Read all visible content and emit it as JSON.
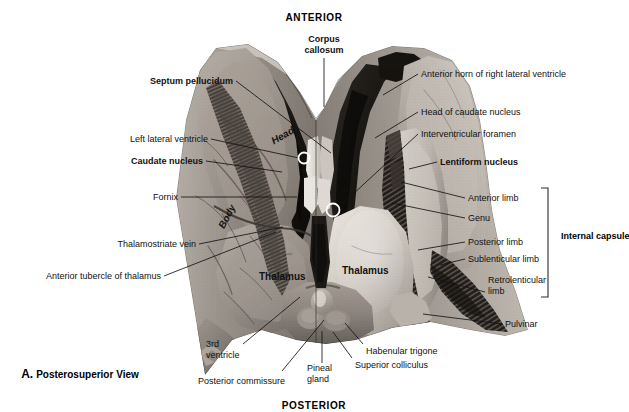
{
  "figure": {
    "panel_letter": "A.",
    "panel_title": "Posterosuperior View",
    "orientation_top": "ANTERIOR",
    "orientation_bottom": "POSTERIOR",
    "view_type": "Posterosuperior View",
    "colors": {
      "background": "#ffffff",
      "text": "#111111",
      "leader_line": "#1a1a1a",
      "bracket": "#2a2a2a",
      "marker_ring": "#ffffff",
      "specimen_light": "#d8d4cf",
      "specimen_mid": "#9b948d",
      "specimen_dark": "#3a3733",
      "specimen_darkest": "#141312"
    }
  },
  "labels_left": [
    {
      "id": "septum-pellucidum",
      "text": "Septum pellucidum",
      "bold": true,
      "x": 233,
      "y": 76,
      "line": [
        236,
        81,
        331,
        153
      ]
    },
    {
      "id": "left-lateral-ventricle",
      "text": "Left lateral ventricle",
      "bold": false,
      "x": 208,
      "y": 134,
      "line": [
        211,
        139,
        299,
        158
      ]
    },
    {
      "id": "caudate-nucleus",
      "text": "Caudate nucleus",
      "bold": true,
      "x": 203,
      "y": 156,
      "line": [
        206,
        161,
        282,
        172
      ]
    },
    {
      "id": "fornix",
      "text": "Fornix",
      "bold": false,
      "x": 178,
      "y": 192,
      "line": [
        181,
        197,
        297,
        197
      ]
    },
    {
      "id": "thalamostriate-vein",
      "text": "Thalamostriate vein",
      "bold": false,
      "x": 196,
      "y": 239,
      "line": [
        199,
        244,
        283,
        227
      ]
    },
    {
      "id": "anterior-tubercle-of-thalamus",
      "text": "Anterior tubercle of thalamus",
      "bold": false,
      "x": 161,
      "y": 271,
      "line": [
        164,
        276,
        276,
        232
      ]
    }
  ],
  "labels_right": [
    {
      "id": "anterior-horn-of-right-lateral-ventricle",
      "text": "Anterior horn of right lateral ventricle",
      "bold": false,
      "x": 421,
      "y": 69,
      "line": [
        418,
        74,
        383,
        95
      ]
    },
    {
      "id": "head-of-caudate-nucleus",
      "text": "Head of caudate nucleus",
      "bold": false,
      "x": 421,
      "y": 107,
      "line": [
        418,
        112,
        375,
        138
      ]
    },
    {
      "id": "interventricular-foramen",
      "text": "Interventricular foramen",
      "bold": false,
      "x": 421,
      "y": 129,
      "line": [
        418,
        134,
        338,
        208
      ]
    },
    {
      "id": "lentiform-nucleus",
      "text": "Lentiform nucleus",
      "bold": true,
      "x": 440,
      "y": 157,
      "line": [
        437,
        162,
        409,
        169
      ]
    },
    {
      "id": "anterior-limb",
      "text": "Anterior limb",
      "bold": false,
      "x": 468,
      "y": 193,
      "line": [
        465,
        198,
        401,
        182
      ]
    },
    {
      "id": "genu",
      "text": "Genu",
      "bold": false,
      "x": 468,
      "y": 213,
      "line": [
        465,
        218,
        392,
        203
      ]
    },
    {
      "id": "posterior-limb",
      "text": "Posterior limb",
      "bold": false,
      "x": 468,
      "y": 237,
      "line": [
        465,
        242,
        418,
        250
      ]
    },
    {
      "id": "sublenticular-limb",
      "text": "Sublenticular limb",
      "bold": false,
      "x": 468,
      "y": 254,
      "line": [
        465,
        259,
        440,
        265
      ]
    },
    {
      "id": "retrolenticular-limb",
      "text": "Retrolenticular\nlimb",
      "bold": false,
      "x": 488,
      "y": 275,
      "line": [
        485,
        292,
        428,
        277
      ]
    },
    {
      "id": "pulvinar",
      "text": "Pulvinar",
      "bold": false,
      "x": 505,
      "y": 319,
      "line": [
        502,
        324,
        423,
        314
      ]
    }
  ],
  "labels_bottom": [
    {
      "id": "third-ventricle",
      "text": "3rd\nventricle",
      "bold": false,
      "x": 206,
      "y": 339,
      "line": [
        243,
        344,
        300,
        297
      ]
    },
    {
      "id": "posterior-commissure",
      "text": "Posterior commissure",
      "bold": false,
      "x": 198,
      "y": 376,
      "line": [
        282,
        371,
        324,
        320
      ]
    },
    {
      "id": "pineal-gland",
      "text": "Pineal\ngland",
      "bold": false,
      "x": 307,
      "y": 363,
      "line": [
        322,
        363,
        322,
        331
      ]
    },
    {
      "id": "superior-colliculus",
      "text": "Superior colliculus",
      "bold": false,
      "x": 355,
      "y": 360,
      "line": [
        352,
        358,
        333,
        332
      ]
    },
    {
      "id": "habenular-trigone",
      "text": "Habenular trigone",
      "bold": false,
      "x": 366,
      "y": 346,
      "line": [
        363,
        344,
        345,
        323
      ]
    }
  ],
  "labels_on_specimen": [
    {
      "id": "head",
      "text": "Head",
      "x": 272,
      "y": 136,
      "rotate": -30,
      "style": "bold-italic"
    },
    {
      "id": "body",
      "text": "Body",
      "x": 221,
      "y": 222,
      "rotate": -62,
      "style": "bold-italic"
    },
    {
      "id": "thalamus-left",
      "text": "Thalamus",
      "x": 259,
      "y": 271,
      "rotate": 0,
      "style": "bold"
    },
    {
      "id": "thalamus-right",
      "text": "Thalamus",
      "x": 342,
      "y": 265,
      "rotate": 0,
      "style": "bold"
    }
  ],
  "bracket": {
    "label": "Internal capsule",
    "x": 548,
    "y_top": 188,
    "y_bottom": 297,
    "arm": 7,
    "label_x": 561,
    "label_y": 237
  },
  "markers": [
    {
      "id": "septum-pellucidum-marker",
      "cx": 304,
      "cy": 158,
      "r": 5.5
    },
    {
      "id": "interventricular-foramen-marker",
      "cx": 333,
      "cy": 210,
      "r": 6.5
    }
  ],
  "orientation": {
    "anterior": {
      "text": "ANTERIOR",
      "x": 314,
      "y": 12
    },
    "posterior": {
      "text": "POSTERIOR",
      "x": 314,
      "y": 400
    }
  },
  "corpus_callosum": {
    "text": "Corpus\ncallosum",
    "x": 324,
    "y": 36,
    "line": [
      324,
      58,
      324,
      107
    ]
  }
}
